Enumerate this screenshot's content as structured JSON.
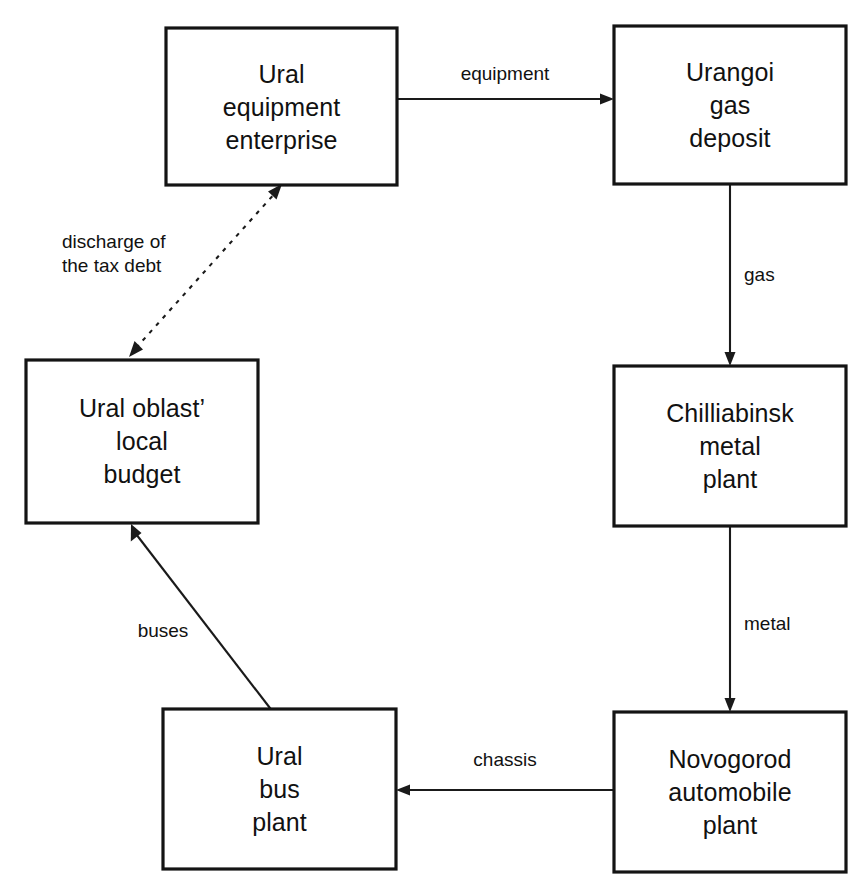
{
  "diagram": {
    "type": "flow-diagram",
    "background_color": "#ffffff",
    "line_color": "#1a1a1a",
    "box_border_color": "#141414",
    "box_fill_color": "#ffffff",
    "nodes": [
      {
        "id": "ural-equipment-enterprise",
        "lines": [
          "Ural",
          "equipment",
          "enterprise"
        ],
        "line1": "Ural",
        "line2": "equipment",
        "line3": "enterprise",
        "x": 166,
        "y": 28,
        "width": 231,
        "height": 157
      },
      {
        "id": "urangoi-gas-deposit",
        "lines": [
          "Urangoi",
          "gas",
          "deposit"
        ],
        "line1": "Urangoi",
        "line2": "gas",
        "line3": "deposit",
        "x": 614,
        "y": 26,
        "width": 232,
        "height": 158
      },
      {
        "id": "ural-oblast-local-budget",
        "lines": [
          "Ural oblast’",
          "local",
          "budget"
        ],
        "line1": "Ural oblast’",
        "line2": "local",
        "line3": "budget",
        "x": 26,
        "y": 360,
        "width": 232,
        "height": 163
      },
      {
        "id": "chilliabinsk-metal-plant",
        "lines": [
          "Chilliabinsk",
          "metal",
          "plant"
        ],
        "line1": "Chilliabinsk",
        "line2": "metal",
        "line3": "plant",
        "x": 614,
        "y": 366,
        "width": 232,
        "height": 160
      },
      {
        "id": "ural-bus-plant",
        "lines": [
          "Ural",
          "bus",
          "plant"
        ],
        "line1": "Ural",
        "line2": "bus",
        "line3": "plant",
        "x": 163,
        "y": 709,
        "width": 233,
        "height": 160
      },
      {
        "id": "novogorod-automobile-plant",
        "lines": [
          "Novogorod",
          "automobile",
          "plant"
        ],
        "line1": "Novogorod",
        "line2": "automobile",
        "line3": "plant",
        "x": 614,
        "y": 712,
        "width": 232,
        "height": 160
      }
    ],
    "edges": [
      {
        "id": "equipment",
        "label": "equipment",
        "from": "ural-equipment-enterprise",
        "to": "urangoi-gas-deposit",
        "style": "solid",
        "arrows": "single",
        "direction": "right",
        "label_x": 505,
        "label_y": 80
      },
      {
        "id": "gas",
        "label": "gas",
        "from": "urangoi-gas-deposit",
        "to": "chilliabinsk-metal-plant",
        "style": "solid",
        "arrows": "single",
        "direction": "down",
        "label_x": 757,
        "label_y": 281
      },
      {
        "id": "metal",
        "label": "metal",
        "from": "chilliabinsk-metal-plant",
        "to": "novogorod-automobile-plant",
        "style": "solid",
        "arrows": "single",
        "direction": "down",
        "label_x": 768,
        "label_y": 630
      },
      {
        "id": "chassis",
        "label": "chassis",
        "from": "novogorod-automobile-plant",
        "to": "ural-bus-plant",
        "style": "solid",
        "arrows": "single",
        "direction": "left",
        "label_x": 505,
        "label_y": 766
      },
      {
        "id": "buses",
        "label": "buses",
        "from": "ural-bus-plant",
        "to": "ural-oblast-local-budget",
        "style": "solid",
        "arrows": "single",
        "direction": "up-left",
        "label_x": 163,
        "label_y": 637
      },
      {
        "id": "discharge-of-the-tax-debt",
        "label": "discharge of the tax debt",
        "label_line1": "discharge of",
        "label_line2": "the tax debt",
        "from": "ural-oblast-local-budget",
        "to": "ural-equipment-enterprise",
        "style": "dotted",
        "arrows": "double",
        "direction": "up-right",
        "label_x": 62,
        "label_y": 248
      }
    ]
  }
}
